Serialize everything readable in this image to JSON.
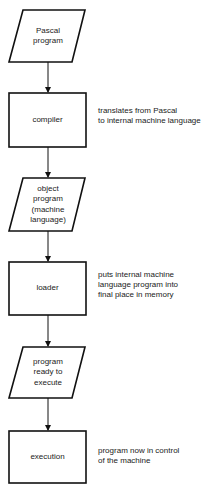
{
  "diagram": {
    "type": "flowchart",
    "direction": "top-to-bottom",
    "colors": {
      "stroke": "#111111",
      "background": "#ffffff",
      "text": "#222222"
    },
    "nodes": [
      {
        "id": "pascal-program",
        "shape": "parallelogram",
        "lines": [
          "Pascal",
          "program"
        ]
      },
      {
        "id": "compiler",
        "shape": "rectangle",
        "lines": [
          "compiler"
        ],
        "note": [
          "translates from Pascal",
          "to internal machine language"
        ]
      },
      {
        "id": "object-program",
        "shape": "parallelogram",
        "lines": [
          "object",
          "program",
          "(machine",
          "language)"
        ]
      },
      {
        "id": "loader",
        "shape": "rectangle",
        "lines": [
          "loader"
        ],
        "note": [
          "puts internal machine",
          "language program into",
          "final place in memory"
        ]
      },
      {
        "id": "program-ready",
        "shape": "parallelogram",
        "lines": [
          "program",
          "ready to",
          "execute"
        ]
      },
      {
        "id": "execution",
        "shape": "rectangle",
        "lines": [
          "execution"
        ],
        "note": [
          "program now in control",
          "of the machine"
        ]
      }
    ],
    "edges": [
      {
        "from": "pascal-program",
        "to": "compiler"
      },
      {
        "from": "compiler",
        "to": "object-program"
      },
      {
        "from": "object-program",
        "to": "loader"
      },
      {
        "from": "loader",
        "to": "program-ready"
      },
      {
        "from": "program-ready",
        "to": "execution"
      }
    ]
  }
}
